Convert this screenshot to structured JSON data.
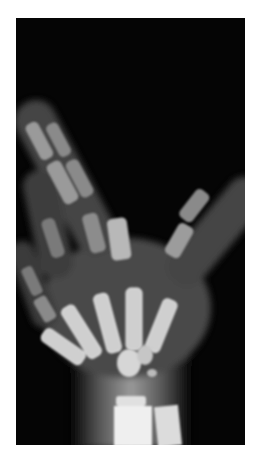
{
  "image": {
    "subject": "Radiograph of a child's hand and wrist",
    "alt": "X-ray of a pediatric hand showing phalanges, metacarpals, carpal ossification centers, and distal radius and ulna",
    "colors": {
      "background": "#ffffff",
      "film": "#050505",
      "soft_tissue": "#4a4a4a",
      "bone": "#d8d8d8",
      "bone_bright": "#f2f2f2"
    }
  }
}
